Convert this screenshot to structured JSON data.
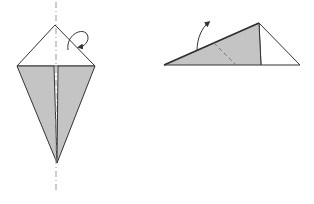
{
  "diagram": {
    "type": "origami-steps",
    "colors": {
      "background": "#ffffff",
      "paper_colored": "#c4c4c4",
      "paper_white": "#ffffff",
      "stroke": "#333333",
      "crease": "#888888"
    },
    "steps": [
      {
        "name": "kite-fold-step",
        "description": "Kite base with vertical center crease; fold behind along center line",
        "annotations": [
          "center-dashed-crease",
          "fold-behind-arrow"
        ]
      },
      {
        "name": "folded-half-step",
        "description": "Folded in half; valley fold indicated by dashed line with curved arrow",
        "annotations": [
          "valley-fold-line",
          "fold-up-arrow"
        ]
      }
    ]
  }
}
